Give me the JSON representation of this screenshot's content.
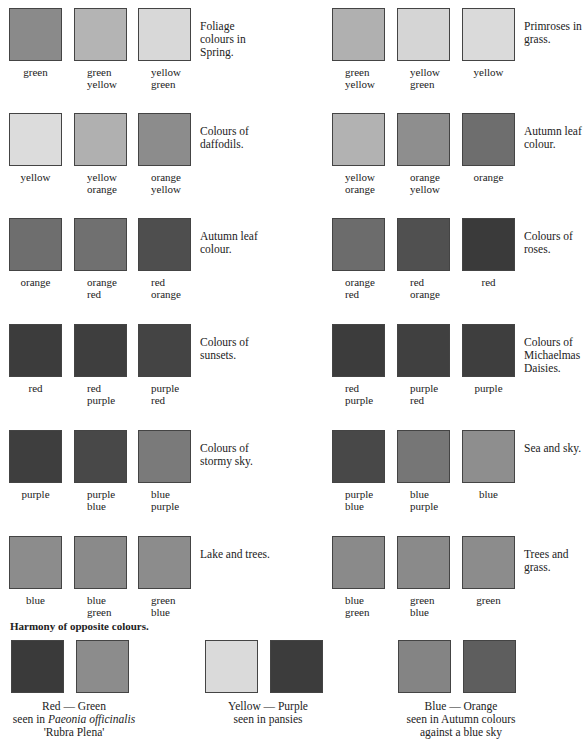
{
  "groups": [
    {
      "desc": "Foliage colours in Spring.",
      "swatches": [
        {
          "label": "green",
          "color": "#8a8a8a"
        },
        {
          "label": "green yellow",
          "color": "#b4b4b4"
        },
        {
          "label": "yellow green",
          "color": "#d8d8d8"
        }
      ]
    },
    {
      "desc": "Primroses in grass.",
      "swatches": [
        {
          "label": "green yellow",
          "color": "#b0b0b0"
        },
        {
          "label": "yellow green",
          "color": "#d5d5d5"
        },
        {
          "label": "yellow",
          "color": "#dadada"
        }
      ]
    },
    {
      "desc": "Colours of daffodils.",
      "swatches": [
        {
          "label": "yellow",
          "color": "#dcdcdc"
        },
        {
          "label": "yellow orange",
          "color": "#b0b0b0"
        },
        {
          "label": "orange yellow",
          "color": "#8c8c8c"
        }
      ]
    },
    {
      "desc": "Autumn leaf colour.",
      "swatches": [
        {
          "label": "yellow orange",
          "color": "#b2b2b2"
        },
        {
          "label": "orange yellow",
          "color": "#8e8e8e"
        },
        {
          "label": "orange",
          "color": "#6e6e6e"
        }
      ]
    },
    {
      "desc": "Autumn leaf colour.",
      "swatches": [
        {
          "label": "orange",
          "color": "#6e6e6e"
        },
        {
          "label": "orange red",
          "color": "#707070"
        },
        {
          "label": "red orange",
          "color": "#4e4e4e"
        }
      ]
    },
    {
      "desc": "Colours of roses.",
      "swatches": [
        {
          "label": "orange red",
          "color": "#6c6c6c"
        },
        {
          "label": "red orange",
          "color": "#505050"
        },
        {
          "label": "red",
          "color": "#3a3a3a"
        }
      ]
    },
    {
      "desc": "Colours of sunsets.",
      "swatches": [
        {
          "label": "red",
          "color": "#3c3c3c"
        },
        {
          "label": "red purple",
          "color": "#3e3e3e"
        },
        {
          "label": "purple red",
          "color": "#444444"
        }
      ]
    },
    {
      "desc": "Colours of Michaelmas Daisies.",
      "swatches": [
        {
          "label": "red purple",
          "color": "#3c3c3c"
        },
        {
          "label": "purple red",
          "color": "#404040"
        },
        {
          "label": "purple",
          "color": "#3e3e3e"
        }
      ]
    },
    {
      "desc": "Colours of stormy sky.",
      "swatches": [
        {
          "label": "purple",
          "color": "#3e3e3e"
        },
        {
          "label": "purple blue",
          "color": "#484848"
        },
        {
          "label": "blue purple",
          "color": "#7a7a7a"
        }
      ]
    },
    {
      "desc": "Sea and sky.",
      "swatches": [
        {
          "label": "purple blue",
          "color": "#484848"
        },
        {
          "label": "blue purple",
          "color": "#767676"
        },
        {
          "label": "blue",
          "color": "#8e8e8e"
        }
      ]
    },
    {
      "desc": "Lake and trees.",
      "swatches": [
        {
          "label": "blue",
          "color": "#8c8c8c"
        },
        {
          "label": "blue green",
          "color": "#8a8a8a"
        },
        {
          "label": "green blue",
          "color": "#8c8c8c"
        }
      ]
    },
    {
      "desc": "Trees and grass.",
      "swatches": [
        {
          "label": "blue green",
          "color": "#8a8a8a"
        },
        {
          "label": "green blue",
          "color": "#8a8a8a"
        },
        {
          "label": "green",
          "color": "#8c8c8c"
        }
      ]
    }
  ],
  "harmony": {
    "title": "Harmony of opposite colours.",
    "pairs": [
      {
        "pair": "Red  — Green",
        "line2_prefix": "seen in ",
        "line2_italic": "Paeonia officinalis",
        "line3": "'Rubra Plena'",
        "colors": [
          "#3a3a3a",
          "#8c8c8c"
        ]
      },
      {
        "pair": "Yellow — Purple",
        "line2_prefix": "seen in pansies",
        "line2_italic": "",
        "line3": "",
        "colors": [
          "#dadada",
          "#3c3c3c"
        ]
      },
      {
        "pair": "Blue  — Orange",
        "line2_prefix": "seen in Autumn colours",
        "line2_italic": "",
        "line3": "against a blue sky",
        "colors": [
          "#848484",
          "#5e5e5e"
        ]
      }
    ]
  }
}
